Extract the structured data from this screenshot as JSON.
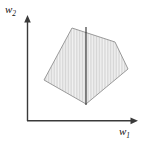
{
  "figure": {
    "name": "convex-polygon-feasible-region-diagram",
    "background_color": "#ffffff",
    "width": 153,
    "height": 144
  },
  "axes": {
    "x_axis": {
      "label_main": "w",
      "label_sub": "1",
      "color": "#3a3a3a",
      "origin_x": 27,
      "origin_y": 121,
      "end_x": 137,
      "arrow": "arrowhead-right"
    },
    "y_axis": {
      "label_main": "w",
      "label_sub": "2",
      "color": "#3a3a3a",
      "origin_x": 27,
      "origin_y": 121,
      "end_y": 17,
      "arrow": "arrowhead-up"
    }
  },
  "region": {
    "shape": "convex-pentagon",
    "fill_color": "#ededed",
    "hatch_color": "#c9c9c9",
    "hatch_pattern": "vertical-lines",
    "stroke_color": "#9a9a9a",
    "vertices": [
      [
        72,
        28
      ],
      [
        115,
        42
      ],
      [
        128,
        69
      ],
      [
        86,
        104
      ],
      [
        44,
        80
      ]
    ]
  },
  "chord": {
    "name": "vertical-chord-line",
    "color": "#2b2b2b",
    "x": 86,
    "y_top": 27,
    "y_bottom": 105
  },
  "chart_data": {
    "type": "scatter",
    "title": "",
    "xlabel": "w1",
    "ylabel": "w2",
    "grid": false,
    "legend": "none",
    "annotations": [
      "convex region shaded with vertical hatching",
      "vertical line segment through region at w1 = 86 px"
    ],
    "polygon_vertices_px": [
      [
        72,
        28
      ],
      [
        115,
        42
      ],
      [
        128,
        69
      ],
      [
        86,
        104
      ],
      [
        44,
        80
      ]
    ]
  }
}
